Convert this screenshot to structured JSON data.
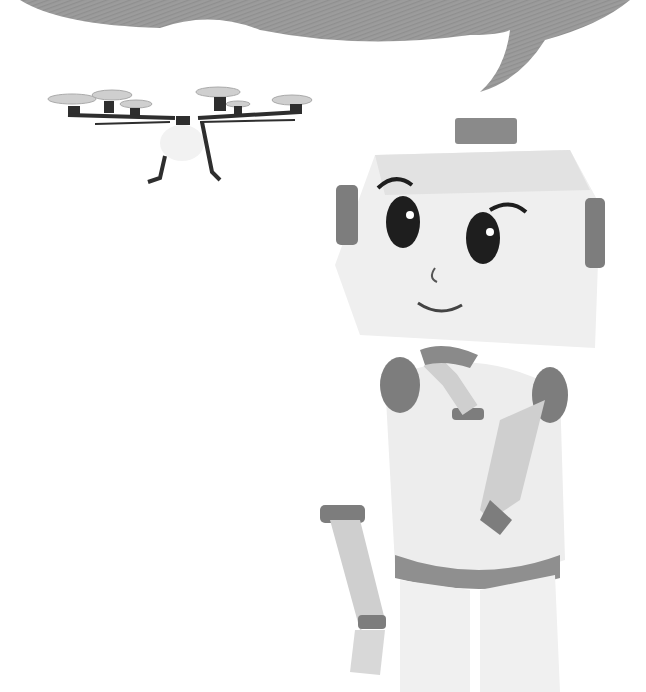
{
  "scene": {
    "description": "Grayscale illustration of a cartoon robot looking up at a hovering drone, with an empty speech bubble above",
    "colors": {
      "background": "#ffffff",
      "bubble": "#9a9a9a",
      "robot_light": "#efefef",
      "robot_mid": "#bdbdbd",
      "robot_dark": "#7d7d7d",
      "drone_dark": "#2e2e2e",
      "propeller": "#c8c8c8"
    }
  },
  "elements": {
    "speech_bubble": {
      "text": ""
    },
    "drone": {
      "propellers": 6
    },
    "robot": {
      "expression": "smiling"
    }
  }
}
